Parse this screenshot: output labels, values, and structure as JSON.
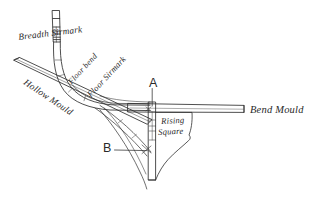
{
  "figure": {
    "type": "engraving-line-drawing",
    "background_color": "#ffffff",
    "ink_color": "#2a2a2a",
    "width": 323,
    "height": 197
  },
  "labels": {
    "breadth_sirmark": "Breadth Sirmark",
    "floor_bend": "Floor bend",
    "floor_sirmark": "Floor Sirmark",
    "hollow_mould": "Hollow Mould",
    "bend_mould": "Bend Mould",
    "rising_square_line1": "Rising",
    "rising_square_line2": "Square",
    "point_a": "A",
    "point_b": "B"
  },
  "parts": {
    "vertical_batten": "vertical-batten-top",
    "curved_ribband_outer": "curved-ribband-outer",
    "curved_ribband_inner": "curved-ribband-inner",
    "hollow_mould_bar": "hollow-mould-bar",
    "bend_mould_bar": "bend-mould-bar",
    "rising_square_profile": "rising-square-profile",
    "center_post": "center-post",
    "lower_curve_brace": "lower-curve-brace",
    "pointer_a": "pointer-line-a",
    "pointer_b": "pointer-line-b"
  }
}
